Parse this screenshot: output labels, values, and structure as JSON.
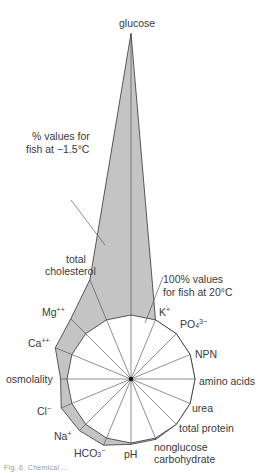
{
  "diagram": {
    "type": "radar",
    "center": [
      131,
      379
    ],
    "reference_radius_px": 64,
    "reference_label": "100% values for fish at 20°C",
    "series_label": "% values for fish at −1.5°C",
    "fill_color": "#c4c4c4",
    "line_color": "#333333",
    "axes": [
      {
        "name": "glucose",
        "angle": 0,
        "percent": 540
      },
      {
        "name": "K+",
        "angle": 22.5,
        "percent": 100
      },
      {
        "name": "PO4 3−",
        "angle": 45,
        "percent": 100
      },
      {
        "name": "NPN",
        "angle": 67.5,
        "percent": 100
      },
      {
        "name": "amino acids",
        "angle": 90,
        "percent": 100
      },
      {
        "name": "urea",
        "angle": 112.5,
        "percent": 100
      },
      {
        "name": "total protein",
        "angle": 135,
        "percent": 100
      },
      {
        "name": "nonglucose carbohydrate",
        "angle": 157.5,
        "percent": 102
      },
      {
        "name": "pH",
        "angle": 180,
        "percent": 102
      },
      {
        "name": "HCO3−",
        "angle": 202.5,
        "percent": 112
      },
      {
        "name": "Na+",
        "angle": 225,
        "percent": 114
      },
      {
        "name": "Cl−",
        "angle": 247.5,
        "percent": 118
      },
      {
        "name": "osmolality",
        "angle": 270,
        "percent": 110
      },
      {
        "name": "Ca++",
        "angle": 292.5,
        "percent": 128
      },
      {
        "name": "Mg++",
        "angle": 315,
        "percent": 133
      },
      {
        "name": "total cholesterol",
        "angle": 337.5,
        "percent": 168
      }
    ]
  },
  "labels": {
    "glucose": "glucose",
    "series_line1": "% values for",
    "series_line2": "fish at −1.5°C",
    "total": "total",
    "cholesterol": "cholesterol",
    "ref_line1": "100% values",
    "ref_line2": "for fish at 20°C",
    "mg": "Mg",
    "mg_sup": "++",
    "ca": "Ca",
    "ca_sup": "++",
    "osmolality": "osmolality",
    "cl": "Cl",
    "cl_sup": "−",
    "na": "Na",
    "na_sup": "+",
    "hco": "HCO",
    "hco_sub": "3",
    "hco_sup": "−",
    "ph": "pH",
    "nonglucose": "nonglucose",
    "carbohydrate": "carbohydrate",
    "total_protein": "total protein",
    "urea": "urea",
    "amino_acids": "amino acids",
    "npn": "NPN",
    "po": "PO",
    "po_sub": "4",
    "po_sup": "3−",
    "k": "K",
    "k_sup": "+"
  },
  "caption": "Fig. 6.  Chemical ..."
}
